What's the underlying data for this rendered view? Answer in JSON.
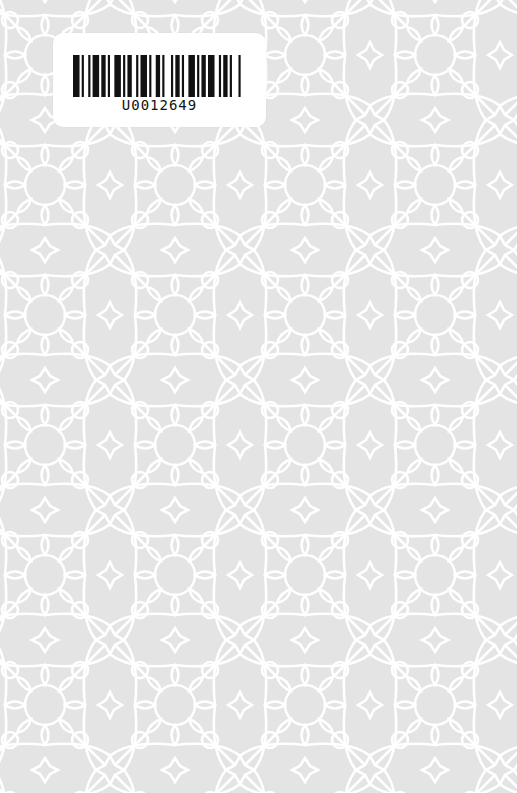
{
  "cover": {
    "background_color": "#e4e4e4",
    "pattern_color": "#ffffff",
    "pattern": "islamic-geometric-star-pattern"
  },
  "label": {
    "barcode_text": "U0012649",
    "bars": [
      3,
      1,
      1,
      2,
      1,
      1,
      3,
      1,
      2,
      1,
      1,
      2,
      3,
      1,
      1,
      1,
      2,
      2,
      1,
      1,
      3,
      1,
      1,
      2,
      2,
      1,
      1,
      3,
      1,
      1,
      2,
      1,
      1,
      2,
      3,
      1,
      1,
      1,
      2,
      1,
      3,
      2,
      1,
      1,
      2,
      1,
      1,
      3,
      1,
      2
    ]
  }
}
